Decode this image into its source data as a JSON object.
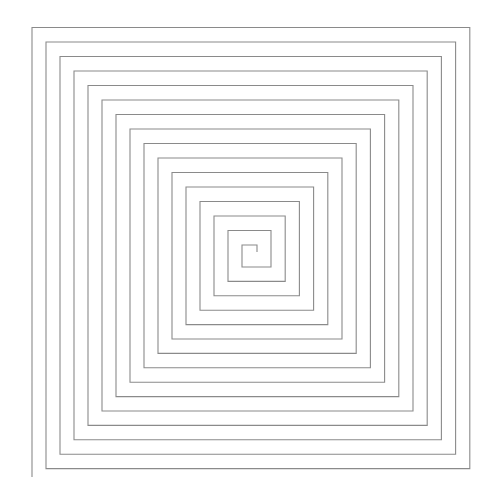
{
  "figure": {
    "type": "square-spiral",
    "background": "#ffffff",
    "stroke_color": "#8a8a8a",
    "stroke_width": 1.1,
    "start": [
      257,
      252
    ],
    "left_lines": {
      "first": 242,
      "step": -14.0,
      "count": 16
    },
    "right_lines": {
      "first": 271,
      "step": 14.2,
      "count": 15
    },
    "top_lines": {
      "first": 245,
      "step": -14.5,
      "count": 16
    },
    "bottom_lines": {
      "first": 267,
      "step": 14.4,
      "count": 15
    },
    "end_y": 477
  }
}
